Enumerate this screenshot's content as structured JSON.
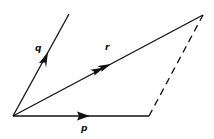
{
  "diagram": {
    "type": "vector parallelogram",
    "stroke_color": "#111111",
    "background": "#ffffff",
    "vectors": [
      {
        "name": "p",
        "label": "p",
        "from": [
          13,
          116
        ],
        "to": [
          149,
          116
        ],
        "arrowheads": 1
      },
      {
        "name": "q",
        "label": "q",
        "from": [
          13,
          116
        ],
        "to": [
          69,
          14
        ],
        "arrowheads": 1
      },
      {
        "name": "r",
        "label": "r",
        "from": [
          13,
          116
        ],
        "to": [
          203,
          15
        ],
        "arrowheads": 2
      }
    ],
    "dashed_edge": {
      "from": [
        149,
        116
      ],
      "to": [
        203,
        15
      ]
    },
    "labels": {
      "p": "p",
      "q": "q",
      "r": "r"
    }
  }
}
